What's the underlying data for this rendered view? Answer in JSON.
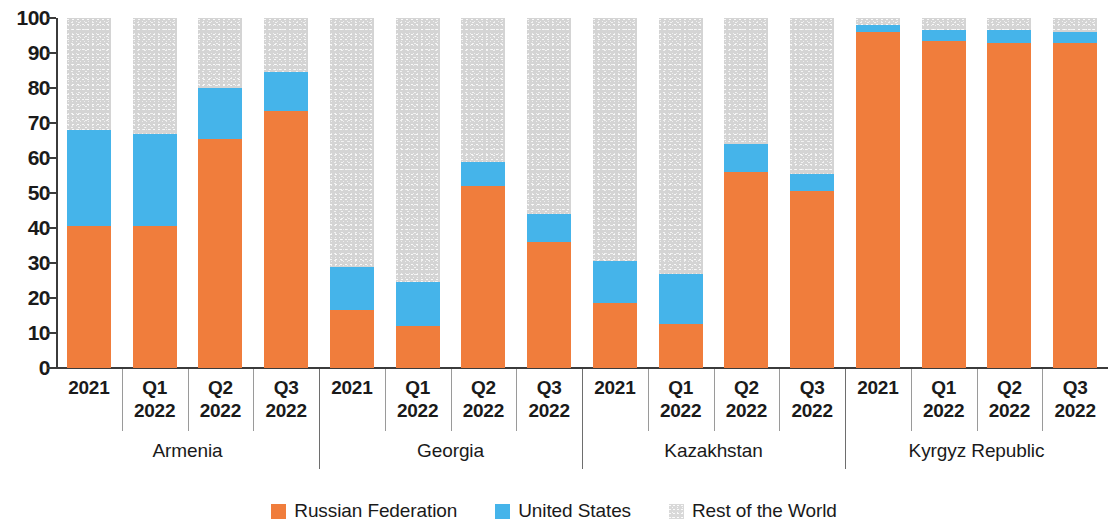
{
  "chart_data": {
    "type": "bar",
    "stacked": true,
    "stacked_mode": "percent",
    "title": "",
    "subtitle": "",
    "xlabel": "",
    "ylabel": "",
    "ylim": [
      0,
      100
    ],
    "ytick_values": [
      0,
      10,
      20,
      30,
      40,
      50,
      60,
      70,
      80,
      90,
      100
    ],
    "ytick_labels": [
      "0",
      "10",
      "20",
      "30",
      "40",
      "50",
      "60",
      "70",
      "80",
      "90",
      "100"
    ],
    "grid": false,
    "legend_position": "bottom-center",
    "legend": [
      "Russian Federation",
      "United States",
      "Rest of the World"
    ],
    "series_colors": {
      "Russian Federation": "#f07d3c",
      "United States": "#45b4ea",
      "Rest of the World": "#d4d4d4"
    },
    "group_labels": [
      "Armenia",
      "Georgia",
      "Kazakhstan",
      "Kyrgyz Republic"
    ],
    "period_labels": [
      "2021",
      "Q1\n2022",
      "Q2\n2022",
      "Q3\n2022"
    ],
    "categories": [
      "Armenia 2021",
      "Armenia Q1 2022",
      "Armenia Q2 2022",
      "Armenia Q3 2022",
      "Georgia 2021",
      "Georgia Q1 2022",
      "Georgia Q2 2022",
      "Georgia Q3 2022",
      "Kazakhstan 2021",
      "Kazakhstan Q1 2022",
      "Kazakhstan Q2 2022",
      "Kazakhstan Q3 2022",
      "Kyrgyz Republic 2021",
      "Kyrgyz Republic Q1 2022",
      "Kyrgyz Republic Q2 2022",
      "Kyrgyz Republic Q3 2022"
    ],
    "series": [
      {
        "name": "Russian Federation",
        "values": [
          40.5,
          40.5,
          65.5,
          73.5,
          16.5,
          12.0,
          52.0,
          36.0,
          18.5,
          12.5,
          56.0,
          50.5,
          96.0,
          93.5,
          93.0,
          93.0
        ]
      },
      {
        "name": "United States",
        "values": [
          27.5,
          26.5,
          14.5,
          11.0,
          12.5,
          12.5,
          7.0,
          8.0,
          12.0,
          14.5,
          8.0,
          5.0,
          2.0,
          3.0,
          3.5,
          3.0
        ]
      },
      {
        "name": "Rest of the World",
        "values": [
          32.0,
          33.0,
          20.0,
          15.5,
          71.0,
          75.5,
          41.0,
          56.0,
          69.5,
          73.0,
          36.0,
          44.5,
          2.0,
          3.5,
          3.5,
          4.0
        ]
      }
    ],
    "cumulative_tops": {
      "russian_federation": [
        40.5,
        40.5,
        65.5,
        73.5,
        16.5,
        12.0,
        52.0,
        36.0,
        18.5,
        12.5,
        56.0,
        50.5,
        96.0,
        93.5,
        93.0,
        93.0
      ],
      "united_states": [
        68.0,
        67.0,
        80.0,
        84.5,
        29.0,
        24.5,
        59.0,
        44.0,
        30.5,
        27.0,
        64.0,
        55.5,
        98.0,
        96.5,
        96.5,
        96.0
      ]
    }
  },
  "groups": [
    {
      "country": "Armenia",
      "periods": [
        {
          "line1": "2021",
          "line2": ""
        },
        {
          "line1": "Q1",
          "line2": "2022"
        },
        {
          "line1": "Q2",
          "line2": "2022"
        },
        {
          "line1": "Q3",
          "line2": "2022"
        }
      ]
    },
    {
      "country": "Georgia",
      "periods": [
        {
          "line1": "2021",
          "line2": ""
        },
        {
          "line1": "Q1",
          "line2": "2022"
        },
        {
          "line1": "Q2",
          "line2": "2022"
        },
        {
          "line1": "Q3",
          "line2": "2022"
        }
      ]
    },
    {
      "country": "Kazakhstan",
      "periods": [
        {
          "line1": "2021",
          "line2": ""
        },
        {
          "line1": "Q1",
          "line2": "2022"
        },
        {
          "line1": "Q2",
          "line2": "2022"
        },
        {
          "line1": "Q3",
          "line2": "2022"
        }
      ]
    },
    {
      "country": "Kyrgyz Republic",
      "periods": [
        {
          "line1": "2021",
          "line2": ""
        },
        {
          "line1": "Q1",
          "line2": "2022"
        },
        {
          "line1": "Q2",
          "line2": "2022"
        },
        {
          "line1": "Q3",
          "line2": "2022"
        }
      ]
    }
  ],
  "legend_items": [
    {
      "label": "Russian Federation",
      "color": "#f07d3c",
      "swatch": "row"
    },
    {
      "label": "United States",
      "color": "#45b4ea",
      "swatch": "usa"
    },
    {
      "label": "Rest of the World",
      "color": "#d4d4d4",
      "swatch": "rest"
    }
  ]
}
